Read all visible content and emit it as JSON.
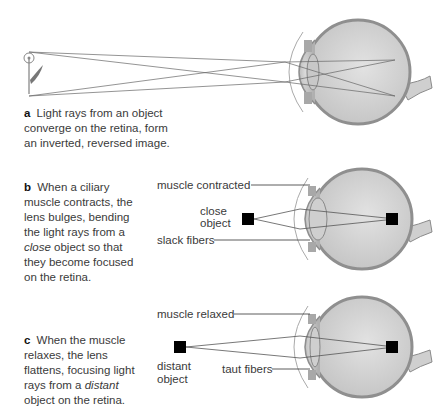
{
  "panels": {
    "a": {
      "letter": "a",
      "caption_line1": "Light rays from an object",
      "caption_line2": "converge on the retina, form",
      "caption_line3": "an inverted, reversed image."
    },
    "b": {
      "letter": "b",
      "caption_p1": "When a ciliary muscle contracts, the lens bulges, bending the light rays from a",
      "caption_italic": "close",
      "caption_p2": "object so that they become focused on the retina.",
      "label_muscle": "muscle contracted",
      "label_object_1": "close",
      "label_object_2": "object",
      "label_fibers": "slack fibers"
    },
    "c": {
      "letter": "c",
      "caption_p1": "When the muscle relaxes, the lens flattens, focusing light rays from a",
      "caption_italic": "distant",
      "caption_p2": "object on the retina.",
      "label_muscle": "muscle relaxed",
      "label_object_1": "distant",
      "label_object_2": "object",
      "label_fibers": "taut fibers"
    }
  },
  "colors": {
    "eye_fill": "#d2d2d2",
    "eye_wall": "#9a9a9a",
    "lens": "#bfbfbf",
    "ray": "#555555",
    "object": "#000000"
  }
}
